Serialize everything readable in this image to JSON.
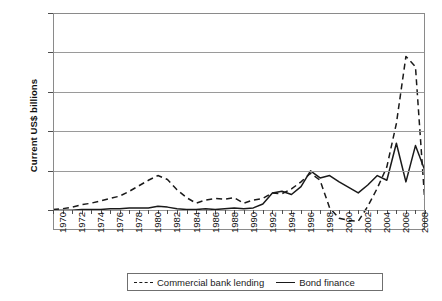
{
  "chart_data": {
    "type": "line",
    "title": "",
    "xlabel": "",
    "ylabel": "Current US$ billions",
    "xlim": [
      1970,
      2009
    ],
    "ylim": [
      -25,
      250
    ],
    "yticks": [
      0,
      50,
      100,
      150,
      200,
      250
    ],
    "ytick_labels": [
      "0",
      "50",
      "100",
      "150",
      "200",
      "250"
    ],
    "xticks": [
      1970,
      1972,
      1974,
      1976,
      1978,
      1980,
      1982,
      1984,
      1986,
      1988,
      1990,
      1992,
      1994,
      1996,
      1998,
      2000,
      2002,
      2004,
      2006,
      2008
    ],
    "xtick_labels": [
      "1970",
      "1972",
      "1974",
      "1976",
      "1978",
      "1980",
      "1982",
      "1984",
      "1986",
      "1988",
      "1990",
      "1992",
      "1994",
      "1996",
      "1998",
      "2000",
      "2002",
      "2004",
      "2006",
      "2008"
    ],
    "grid": true,
    "legend_position": "bottom",
    "x": [
      1970,
      1971,
      1972,
      1973,
      1974,
      1975,
      1976,
      1977,
      1978,
      1979,
      1980,
      1981,
      1982,
      1983,
      1984,
      1985,
      1986,
      1987,
      1988,
      1989,
      1990,
      1991,
      1992,
      1993,
      1994,
      1995,
      1996,
      1997,
      1998,
      1999,
      2000,
      2001,
      2002,
      2003,
      2004,
      2005,
      2006,
      2007,
      2008,
      2009
    ],
    "series": [
      {
        "name": "Commercial bank lending",
        "style": "dashed",
        "color": "#1a1a1a",
        "values": [
          1,
          2,
          4,
          7,
          9,
          12,
          15,
          18,
          24,
          31,
          38,
          44,
          39,
          26,
          16,
          9,
          13,
          15,
          14,
          16,
          9,
          13,
          15,
          22,
          21,
          27,
          36,
          47,
          38,
          3,
          -10,
          -13,
          -14,
          5,
          28,
          55,
          110,
          195,
          182,
          8
        ]
      },
      {
        "name": "Bond finance",
        "style": "solid",
        "color": "#1a1a1a",
        "values": [
          0,
          0,
          0,
          1,
          1,
          1,
          2,
          2,
          3,
          3,
          3,
          5,
          4,
          2,
          1,
          1,
          2,
          1,
          2,
          3,
          2,
          3,
          8,
          22,
          24,
          20,
          30,
          50,
          41,
          44,
          36,
          29,
          22,
          32,
          44,
          38,
          85,
          36,
          82,
          50
        ]
      }
    ]
  },
  "legend": {
    "items": [
      {
        "label": "Commercial bank lending",
        "style": "dashed"
      },
      {
        "label": "Bond finance",
        "style": "solid"
      }
    ]
  }
}
